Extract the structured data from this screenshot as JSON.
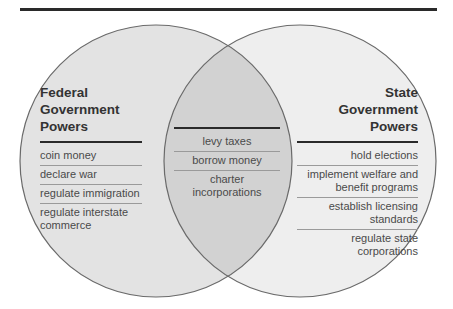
{
  "diagram": {
    "type": "venn",
    "colors": {
      "left_fill": "#e2e2e2",
      "right_fill": "#ececec",
      "overlap_fill": "#d0d0d0",
      "stroke": "#6a6a6a",
      "rule": "#2a2a2a"
    },
    "federal": {
      "title_lines": [
        "Federal",
        "Government",
        "Powers"
      ],
      "items": [
        "coin money",
        "declare war",
        "regulate immigration",
        "regulate interstate commerce"
      ]
    },
    "shared": {
      "items": [
        "levy taxes",
        "borrow money",
        "charter incorporations"
      ]
    },
    "state": {
      "title_lines": [
        "State",
        "Government",
        "Powers"
      ],
      "items": [
        "hold elections",
        "implement welfare and benefit programs",
        "establish licensing standards",
        "regulate state corporations"
      ]
    }
  }
}
